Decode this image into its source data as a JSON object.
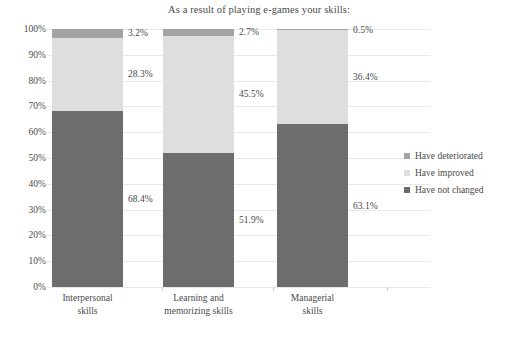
{
  "chart_data": {
    "type": "bar",
    "subtype": "stacked-percent-column",
    "title": "As a result of playing e-games your skills:",
    "xlabel": "",
    "ylabel": "",
    "ylim": [
      0,
      100
    ],
    "yunit": "%",
    "grid": true,
    "legend_position": "right",
    "categories": [
      "Interpersonal skills",
      "Learning and memorizing skills",
      "Managerial skills"
    ],
    "category_lines": [
      [
        "Interpersonal",
        "skills"
      ],
      [
        "Learning and",
        "memorizing skills"
      ],
      [
        "Managerial",
        "skills"
      ]
    ],
    "ytick_labels": [
      "0%",
      "10%",
      "20%",
      "30%",
      "40%",
      "50%",
      "60%",
      "70%",
      "80%",
      "90%",
      "100%"
    ],
    "ytick_values": [
      0,
      10,
      20,
      30,
      40,
      50,
      60,
      70,
      80,
      90,
      100
    ],
    "series": [
      {
        "name": "Have not changed",
        "color": "#6d6d6d",
        "values": [
          68.4,
          51.9,
          63.1
        ],
        "labels": [
          "68.4%",
          "51.9%",
          "63.1%"
        ]
      },
      {
        "name": "Have improved",
        "color": "#dedede",
        "values": [
          28.3,
          45.5,
          36.4
        ],
        "labels": [
          "28.3%",
          "45.5%",
          "36.4%"
        ]
      },
      {
        "name": "Have deteriorated",
        "color": "#a3a3a3",
        "values": [
          3.2,
          2.7,
          0.5
        ],
        "labels": [
          "3.2%",
          "2.7%",
          "0.5%"
        ]
      }
    ],
    "legend_entries": [
      {
        "label": "Have deteriorated",
        "color": "#a3a3a3"
      },
      {
        "label": "Have improved",
        "color": "#dedede"
      },
      {
        "label": "Have not changed",
        "color": "#6d6d6d"
      }
    ]
  }
}
